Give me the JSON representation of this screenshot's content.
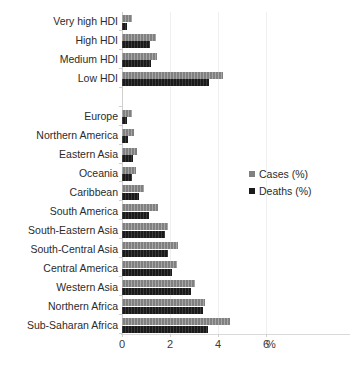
{
  "chart_data": {
    "type": "bar",
    "orientation": "horizontal",
    "title": "",
    "subtitle": "",
    "xlabel": "%",
    "ylabel": "",
    "xlim": [
      0,
      6
    ],
    "xticks": [
      0,
      2,
      4,
      6
    ],
    "xticklabels": [
      "0",
      "2",
      "4",
      "6"
    ],
    "grid": true,
    "grid_axis": "x",
    "legend_position": "right",
    "categories": [
      "Very high HDI",
      "High HDI",
      "Medium HDI",
      "Low HDI",
      "",
      "Europe",
      "Northern America",
      "Eastern Asia",
      "Oceania",
      "Caribbean",
      "South America",
      "South-Eastern Asia",
      "South-Central Asia",
      "Central America",
      "Western Asia",
      "Northern Africa",
      "Sub-Saharan Africa"
    ],
    "series": [
      {
        "name": "Cases (%)",
        "color": "#808080",
        "values": [
          0.42,
          1.4,
          1.45,
          4.2,
          null,
          0.4,
          0.5,
          0.62,
          0.58,
          0.92,
          1.5,
          1.92,
          2.32,
          2.3,
          3.05,
          3.45,
          4.52
        ]
      },
      {
        "name": "Deaths (%)",
        "color": "#1a1a1a",
        "values": [
          0.2,
          1.18,
          1.2,
          3.62,
          null,
          0.22,
          0.24,
          0.46,
          0.4,
          0.72,
          1.12,
          1.8,
          1.9,
          2.1,
          2.88,
          3.38,
          3.6
        ]
      }
    ]
  },
  "legend": {
    "items": [
      {
        "label": "Cases (%)",
        "swatch": "cases"
      },
      {
        "label": "Deaths (%)",
        "swatch": "deaths"
      }
    ]
  },
  "axis": {
    "unit_label": "%"
  }
}
